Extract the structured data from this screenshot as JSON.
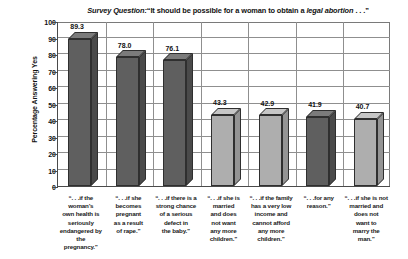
{
  "chart_data": {
    "type": "bar",
    "title_parts": {
      "prefix": "Survey Question:",
      "quote_open": "“It should be possible for a woman to obtain a ",
      "emphasis": "legal abortion",
      "quote_close": " . . .”"
    },
    "xlabel": "",
    "ylabel": "Percentage Answering Yes",
    "ylim": [
      0,
      100
    ],
    "ytick_step": 10,
    "yticks": [
      0,
      10,
      20,
      30,
      40,
      50,
      60,
      70,
      80,
      90,
      100
    ],
    "grid": true,
    "legend": "none",
    "categories": [
      "“. . .if the woman’s own health is seriously endangered by the pregnancy.”",
      "“. . .if she becomes pregnant as a result of rape.”",
      "“. . .if there is a strong chance of a serious defect in the baby.”",
      "“. . .if she is married and does not want any more children.”",
      "“. . .if the family has a very low income and cannot afford any more children.”",
      "“. . .for any reason.”",
      "“. . .if she is not married and does not want to marry the man.”"
    ],
    "category_lines": [
      [
        "“. . .if the",
        "woman’s",
        "own health is",
        "seriously",
        "endangered by",
        "the pregnancy.”"
      ],
      [
        "“. . .if she",
        "becomes",
        "pregnant",
        "as a result",
        "of rape.”"
      ],
      [
        "“. . .if there is a",
        "strong chance",
        "of a serious",
        "defect in",
        "the baby.”"
      ],
      [
        "“. . .if she is",
        "married",
        "and does",
        "not want",
        "any more",
        "children.”"
      ],
      [
        "“. . .if the family",
        "has a very low",
        "income and",
        "cannot afford",
        "any more",
        "children.”"
      ],
      [
        "“. . .for any",
        "reason.”"
      ],
      [
        "“. . .if she is not",
        "married and",
        "does not",
        "want to",
        "marry the man.”"
      ]
    ],
    "values": [
      89.3,
      78.0,
      76.1,
      43.3,
      42.9,
      41.9,
      40.7
    ],
    "value_labels": [
      "89.3",
      "78.0",
      "76.1",
      "43.3",
      "42.9",
      "41.9",
      "40.7"
    ],
    "bar_shades": [
      "dark",
      "dark",
      "dark",
      "light",
      "light",
      "dark",
      "light"
    ],
    "colors": {
      "bar_dark": "#5f5f5f",
      "bar_light": "#aeaeae",
      "axis": "#4a4a4a",
      "grid": "#8f8f8f",
      "text": "#111111",
      "background": "#ffffff"
    }
  }
}
